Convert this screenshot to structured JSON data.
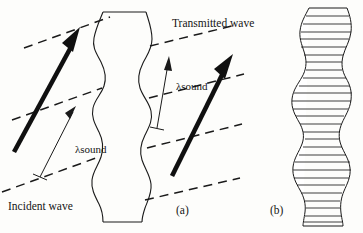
{
  "figure": {
    "background_color": "#fdfdfb",
    "ink_color": "#151515",
    "width": 363,
    "height": 233,
    "labels": {
      "incident_wave": "Incident wave",
      "transmitted_wave": "Transmitted wave",
      "wavelength_incident": "λsound",
      "wavelength_transmitted": "λsound",
      "panel_a": "(a)",
      "panel_b": "(b)"
    },
    "panel_a": {
      "description": "Acoustic plane wave crossing a wavy-walled medium slab",
      "medium_slab": {
        "left_boundary_x": 95,
        "right_boundary_x": 152,
        "top_y": 12,
        "bottom_y": 222,
        "waviness": "sinusoidal vertical edges"
      },
      "incident_arrow": {
        "x1": 14,
        "y1": 152,
        "x2": 80,
        "y2": 30,
        "style": "thick solid with filled arrowhead"
      },
      "transmitted_arrow": {
        "x1": 172,
        "y1": 176,
        "x2": 232,
        "y2": 56,
        "style": "thick solid with filled arrowhead"
      },
      "incident_wavefronts": [
        {
          "x1": 2,
          "y1": 192,
          "x2": 92,
          "y2": 155
        },
        {
          "x1": 12,
          "y1": 120,
          "x2": 100,
          "y2": 84
        },
        {
          "x1": 26,
          "y1": 50,
          "x2": 108,
          "y2": 16
        }
      ],
      "transmitted_wavefronts": [
        {
          "x1": 150,
          "y1": 198,
          "x2": 238,
          "y2": 176
        },
        {
          "x1": 152,
          "y1": 146,
          "x2": 240,
          "y2": 122
        },
        {
          "x1": 152,
          "y1": 96,
          "x2": 240,
          "y2": 72
        },
        {
          "x1": 152,
          "y1": 44,
          "x2": 232,
          "y2": 24
        }
      ],
      "wavelength_caliper_incident": {
        "from_x": 40,
        "from_y": 176,
        "to_x": 76,
        "to_y": 107
      },
      "wavelength_caliper_transmitted": {
        "from_x": 155,
        "from_y": 128,
        "to_x": 168,
        "to_y": 60
      }
    },
    "panel_b": {
      "description": "Stack of thin horizontal layers with wavy left and right edges",
      "left_edge_x": 292,
      "right_edge_x": 350,
      "top_y": 8,
      "bottom_y": 226,
      "layer_count": 28,
      "layer_height": 7.8
    }
  }
}
